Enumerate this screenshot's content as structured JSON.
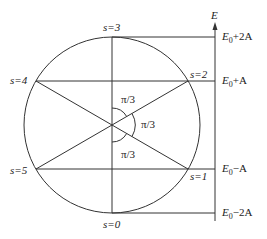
{
  "diagram": {
    "axis_label": "E",
    "states": [
      {
        "s": "s=0",
        "label": "s=0"
      },
      {
        "s": "s=1",
        "label": "s=1"
      },
      {
        "s": "s=2",
        "label": "s=2"
      },
      {
        "s": "s=3",
        "label": "s=3"
      },
      {
        "s": "s=4",
        "label": "s=4"
      },
      {
        "s": "s=5",
        "label": "s=5"
      }
    ],
    "energies": [
      {
        "base": "E",
        "sub": "0",
        "suffix": "+2A"
      },
      {
        "base": "E",
        "sub": "0",
        "suffix": "+A"
      },
      {
        "base": "E",
        "sub": "0",
        "suffix": "−A"
      },
      {
        "base": "E",
        "sub": "0",
        "suffix": "−2A"
      }
    ],
    "angles": [
      "π/3",
      "π/3",
      "π/3"
    ],
    "colors": {
      "line": "#333333",
      "text": "#222222",
      "background": "#ffffff"
    }
  }
}
